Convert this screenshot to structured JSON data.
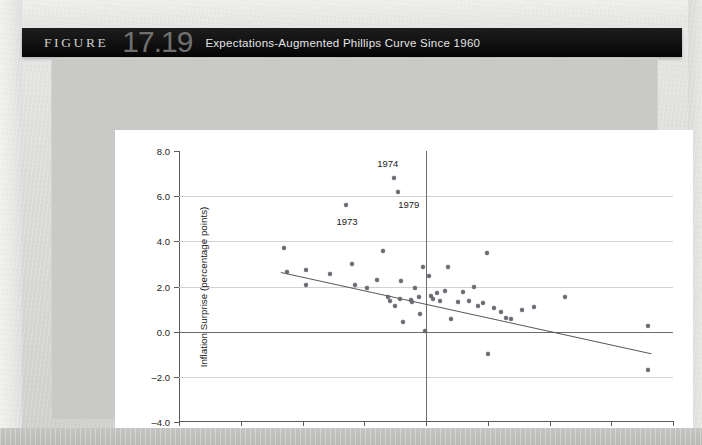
{
  "figure": {
    "label": "FIGURE",
    "number": "17.19",
    "title": "Expectations-Augmented Phillips Curve Since 1960"
  },
  "chart_data": {
    "type": "scatter",
    "title": "Expectations-Augmented Phillips Curve Since 1960",
    "xlabel": "Unemployment Gap (percentage points)",
    "ylabel": "Inflation Surprise (percentage points)",
    "xlim": [
      -4.0,
      4.0
    ],
    "ylim": [
      -4.0,
      8.0
    ],
    "xticks": [
      "-4.0",
      "-3.0",
      "-2.0",
      "-1.0",
      "0.0",
      "1.0",
      "2.0",
      "3.0",
      "4.0"
    ],
    "xtick_values": [
      -4.0,
      -3.0,
      -2.0,
      -1.0,
      0.0,
      1.0,
      2.0,
      3.0,
      4.0
    ],
    "yticks": [
      "8.0",
      "6.0",
      "4.0",
      "2.0",
      "0.0",
      "-2.0",
      "-4.0"
    ],
    "ytick_values": [
      8.0,
      6.0,
      4.0,
      2.0,
      0.0,
      -2.0,
      -4.0
    ],
    "grid": "horizontal",
    "legend": "none",
    "marker_color": "#6a6a72",
    "fitline_color": "#56565c",
    "gridline_color": "#d2d2d2",
    "axis_color": "#5b5b5b",
    "points": [
      [
        -2.3,
        3.7
      ],
      [
        -2.25,
        2.65
      ],
      [
        -1.95,
        2.05
      ],
      [
        -1.95,
        2.75
      ],
      [
        -1.55,
        2.55
      ],
      [
        -1.3,
        5.6
      ],
      [
        -1.2,
        3.0
      ],
      [
        -1.15,
        2.05
      ],
      [
        -0.95,
        1.95
      ],
      [
        -0.8,
        2.3
      ],
      [
        -0.7,
        3.55
      ],
      [
        -0.62,
        1.55
      ],
      [
        -0.58,
        1.35
      ],
      [
        -0.52,
        6.8
      ],
      [
        -0.5,
        1.15
      ],
      [
        -0.45,
        6.2
      ],
      [
        -0.42,
        1.45
      ],
      [
        -0.4,
        2.25
      ],
      [
        -0.38,
        0.45
      ],
      [
        -0.25,
        1.4
      ],
      [
        -0.22,
        1.3
      ],
      [
        -0.18,
        1.95
      ],
      [
        -0.12,
        1.55
      ],
      [
        -0.1,
        0.8
      ],
      [
        -0.05,
        2.85
      ],
      [
        -0.02,
        0.05
      ],
      [
        0.05,
        2.45
      ],
      [
        0.08,
        1.6
      ],
      [
        0.12,
        1.45
      ],
      [
        0.18,
        1.7
      ],
      [
        0.22,
        1.35
      ],
      [
        0.3,
        1.8
      ],
      [
        0.35,
        2.85
      ],
      [
        0.4,
        0.55
      ],
      [
        0.52,
        1.3
      ],
      [
        0.6,
        1.75
      ],
      [
        0.7,
        1.35
      ],
      [
        0.78,
        2.0
      ],
      [
        0.85,
        1.15
      ],
      [
        0.92,
        1.25
      ],
      [
        0.98,
        3.5
      ],
      [
        1.0,
        -1.0
      ],
      [
        1.1,
        1.05
      ],
      [
        1.22,
        0.85
      ],
      [
        1.3,
        0.6
      ],
      [
        1.38,
        0.55
      ],
      [
        1.55,
        0.95
      ],
      [
        1.75,
        1.1
      ],
      [
        2.25,
        1.55
      ],
      [
        3.6,
        0.25
      ],
      [
        3.6,
        -1.7
      ]
    ],
    "annotations": [
      {
        "text": "1974",
        "x": -0.52,
        "y": 6.8,
        "label_x": -0.62,
        "label_y": 7.45
      },
      {
        "text": "1979",
        "x": -0.45,
        "y": 6.2,
        "label_x": -0.28,
        "label_y": 5.65
      },
      {
        "text": "1973",
        "x": -1.3,
        "y": 5.6,
        "label_x": -1.28,
        "label_y": 4.9
      }
    ],
    "fitline": {
      "x0": -2.35,
      "y0": 2.62,
      "x1": 3.65,
      "y1": -0.98
    }
  }
}
